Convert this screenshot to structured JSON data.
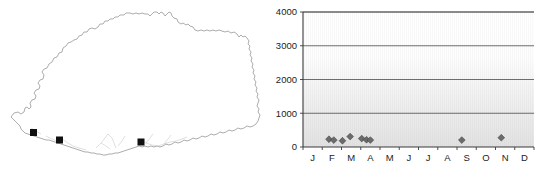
{
  "figure": {
    "panels": [
      "distribution-map",
      "seasonality-chart"
    ]
  },
  "map": {
    "region_name": "Bhutan",
    "marker_symbol": "filled-square",
    "marker_count": 3,
    "marker_color": "#101010",
    "outline_color": "#8a8a8a",
    "markers": [
      {
        "label": "site-1",
        "x": 33.5,
        "y": 132.5
      },
      {
        "label": "site-2",
        "x": 59.5,
        "y": 140.0
      },
      {
        "label": "site-3",
        "x": 141.0,
        "y": 142.0
      }
    ]
  },
  "chart_data": {
    "type": "scatter",
    "title": "",
    "xlabel": "",
    "ylabel": "",
    "categories": [
      "J",
      "F",
      "M",
      "A",
      "M",
      "J",
      "J",
      "A",
      "S",
      "O",
      "N",
      "D"
    ],
    "xlim": [
      0,
      12
    ],
    "ylim": [
      0,
      4000
    ],
    "yticks": [
      0,
      1000,
      2000,
      3000,
      4000
    ],
    "ytick_labels": [
      "0",
      "1000",
      "2000",
      "3000",
      "4000"
    ],
    "grid": "horizontal",
    "legend": "none",
    "marker": "diamond",
    "marker_color": "#6b6b6b",
    "points": [
      {
        "month": "F",
        "x": 1.35,
        "y": 230
      },
      {
        "month": "F",
        "x": 1.6,
        "y": 205
      },
      {
        "month": "M",
        "x": 2.05,
        "y": 185
      },
      {
        "month": "M",
        "x": 2.45,
        "y": 310
      },
      {
        "month": "A",
        "x": 3.05,
        "y": 250
      },
      {
        "month": "A",
        "x": 3.3,
        "y": 215
      },
      {
        "month": "A",
        "x": 3.5,
        "y": 205
      },
      {
        "month": "S",
        "x": 8.25,
        "y": 205
      },
      {
        "month": "N",
        "x": 10.3,
        "y": 275
      }
    ]
  }
}
